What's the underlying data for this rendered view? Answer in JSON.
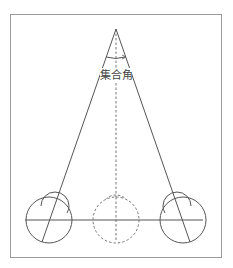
{
  "diagram": {
    "angle_label": "集合角",
    "colors": {
      "frame": "#9a9a9a",
      "line": "#555555",
      "dashed": "#777777",
      "background": "#ffffff"
    },
    "elements": {
      "left_eye": "solid circles with gaze line",
      "center_eye": "dashed circles (cyclopean eye)",
      "right_eye": "solid circles with gaze line",
      "fixation_point": "apex of converging lines",
      "baseline": "horizontal interocular line"
    }
  }
}
